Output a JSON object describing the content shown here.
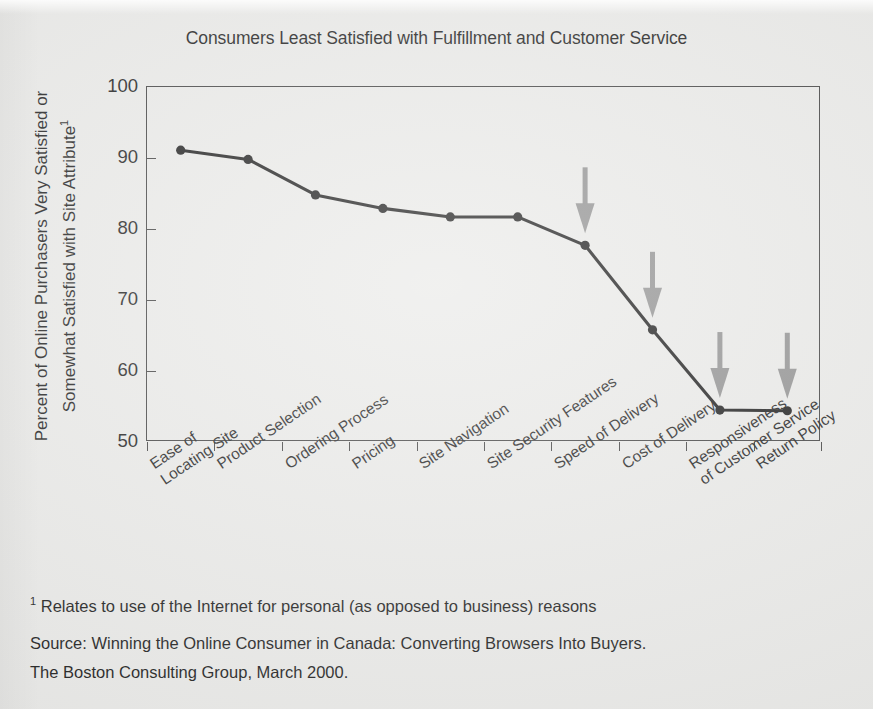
{
  "chart_data": {
    "type": "line",
    "title": "Consumers Least Satisfied with Fulfillment and Customer Service",
    "xlabel": "",
    "ylabel": "Percent of Online Purchasers Very Satisfied or Somewhat Satisfied with Site Attribute",
    "ylabel_line1": "Percent of Online Purchasers Very Satisfied or",
    "ylabel_line2": "Somewhat Satisfied with Site Attribute",
    "ylabel_superscript": "1",
    "ylim": [
      50,
      100
    ],
    "yticks": [
      50,
      60,
      70,
      80,
      90,
      100
    ],
    "grid": false,
    "legend": "none",
    "categories": [
      "Ease of Locating Site",
      "Product Selection",
      "Ordering Process",
      "Pricing",
      "Site Navigation",
      "Site Security Features",
      "Speed of Delivery",
      "Cost of Delivery",
      "Responsiveness of Customer Service",
      "Return Policy"
    ],
    "category_lines": [
      [
        "Ease of",
        "Locating Site"
      ],
      [
        "Product Selection"
      ],
      [
        "Ordering Process"
      ],
      [
        "Pricing"
      ],
      [
        "Site Navigation"
      ],
      [
        "Site Security Features"
      ],
      [
        "Speed of Delivery"
      ],
      [
        "Cost of Delivery"
      ],
      [
        "Responsiveness",
        "of Customer Service"
      ],
      [
        "Return Policy"
      ]
    ],
    "values": [
      91.1,
      89.8,
      84.8,
      82.9,
      81.7,
      81.7,
      77.7,
      65.8,
      54.5,
      54.4
    ],
    "annotations": [
      {
        "type": "arrow",
        "target_category": "Speed of Delivery",
        "direction": "down"
      },
      {
        "type": "arrow",
        "target_category": "Cost of Delivery",
        "direction": "down"
      },
      {
        "type": "arrow",
        "target_category": "Responsiveness of Customer Service",
        "direction": "down"
      },
      {
        "type": "arrow",
        "target_category": "Return Policy",
        "direction": "down"
      }
    ],
    "colors": {
      "line": "#141414",
      "marker": "#141414",
      "arrow": "#8d8d8d",
      "axis": "#3a3a3a",
      "background": "#e9e9e7"
    }
  },
  "footnotes": {
    "marker": "1",
    "text": " Relates to use of the Internet for personal (as opposed to business) reasons",
    "source_line1": "Source: Winning the Online Consumer in Canada: Converting Browsers Into Buyers.",
    "source_line2": "The Boston Consulting Group, March 2000."
  }
}
